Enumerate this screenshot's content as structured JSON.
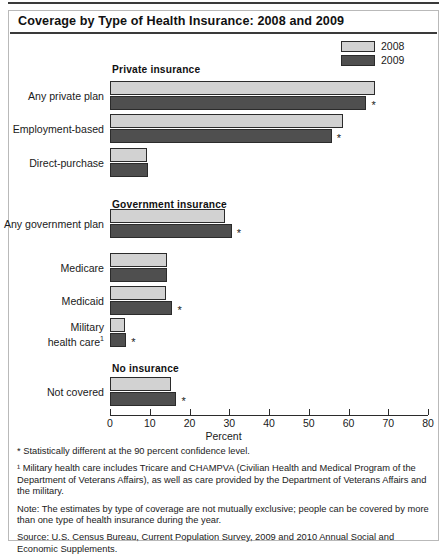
{
  "title": "Coverage by Type of Health Insurance: 2008 and 2009",
  "legend": {
    "items": [
      {
        "label": "2008",
        "color": "#d2d2d2",
        "swatch_icon": "legend-swatch-light"
      },
      {
        "label": "2009",
        "color": "#4f4f4f",
        "swatch_icon": "legend-swatch-dark"
      }
    ]
  },
  "axis": {
    "title": "Percent",
    "ticks": [
      "0",
      "10",
      "20",
      "30",
      "40",
      "50",
      "60",
      "70",
      "80"
    ],
    "min": 0,
    "max": 80
  },
  "groups": [
    {
      "heading": "Private insurance"
    },
    {
      "heading": "Government insurance"
    },
    {
      "heading": "No insurance"
    }
  ],
  "notes": [
    "* Statistically different at the 90 percent confidence level.",
    "¹ Military health care includes Tricare and CHAMPVA (Civilian Health and Medical Program of the Department of Veterans Affairs), as well as care provided by the Department of Veterans Affairs and the military.",
    "Note: The estimates by type of coverage are not mutually exclusive; people can be covered by more than one type of health insurance during the year.",
    "Source: U.S. Census Bureau, Current Population Survey, 2009 and 2010 Annual Social and Economic Supplements."
  ],
  "chart_data": {
    "type": "bar",
    "orientation": "horizontal",
    "title": "Coverage by Type of Health Insurance: 2008 and 2009",
    "xlabel": "Percent",
    "ylabel": "",
    "xlim": [
      0,
      80
    ],
    "xticks": [
      0,
      10,
      20,
      30,
      40,
      50,
      60,
      70,
      80
    ],
    "grid": false,
    "legend_position": "top-right",
    "categories": [
      "Any private plan",
      "Employment-based",
      "Direct-purchase",
      "Any government plan",
      "Medicare",
      "Medicaid",
      "Military health care¹",
      "Not covered"
    ],
    "group_of_category": [
      "Private insurance",
      "Private insurance",
      "Private insurance",
      "Government insurance",
      "Government insurance",
      "Government insurance",
      "Government insurance",
      "No insurance"
    ],
    "series": [
      {
        "name": "2008",
        "color": "#d2d2d2",
        "values": [
          66.7,
          58.5,
          9.4,
          29.0,
          14.3,
          14.1,
          3.8,
          15.4
        ]
      },
      {
        "name": "2009",
        "color": "#4f4f4f",
        "values": [
          64.5,
          55.8,
          9.5,
          30.6,
          14.3,
          15.7,
          4.1,
          16.7
        ]
      }
    ],
    "significance_markers": {
      "symbol": "*",
      "meaning": "Statistically different at the 90 percent confidence level.",
      "on_2009_bars": [
        "Any private plan",
        "Employment-based",
        "Any government plan",
        "Medicaid",
        "Military health care¹",
        "Not covered"
      ]
    }
  }
}
